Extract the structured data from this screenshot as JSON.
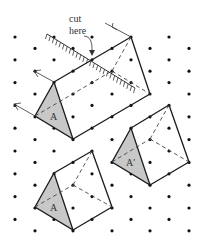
{
  "diagram": {
    "labels": {
      "cut_line1": "cut",
      "cut_line2": "here",
      "face_big": "A",
      "face_right": "A′",
      "face_bottom": "A"
    },
    "colors": {
      "line": "#1a1a1a",
      "dot": "#111111",
      "face_fill": "#c8c8c8",
      "dashed": "#444444"
    },
    "grid": {
      "columns_x": [
        15,
        35,
        54,
        73,
        92,
        112,
        131,
        150,
        169,
        189
      ],
      "row_spacing": 11.4,
      "first_row_y": 37
    }
  }
}
